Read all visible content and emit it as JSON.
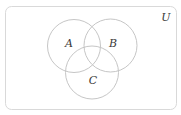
{
  "diagram": {
    "type": "venn",
    "universe": {
      "label": "U",
      "x": 5.5,
      "y": 6.5,
      "width": 171,
      "height": 103,
      "corner_radius": 6,
      "label_x": 166,
      "label_y": 21
    },
    "sets": [
      {
        "label": "A",
        "cx": 74,
        "cy": 46,
        "r": 26.5,
        "label_x": 69,
        "label_y": 47
      },
      {
        "label": "B",
        "cx": 110.5,
        "cy": 45.5,
        "r": 26.5,
        "label_x": 113,
        "label_y": 47
      },
      {
        "label": "C",
        "cx": 92,
        "cy": 72.5,
        "r": 26.5,
        "label_x": 93,
        "label_y": 84
      }
    ],
    "colors": {
      "circle_stroke": "#c6c6c6",
      "border_stroke": "#d9d9d9",
      "label_text": "#3a3a3a",
      "background": "#ffffff"
    }
  }
}
